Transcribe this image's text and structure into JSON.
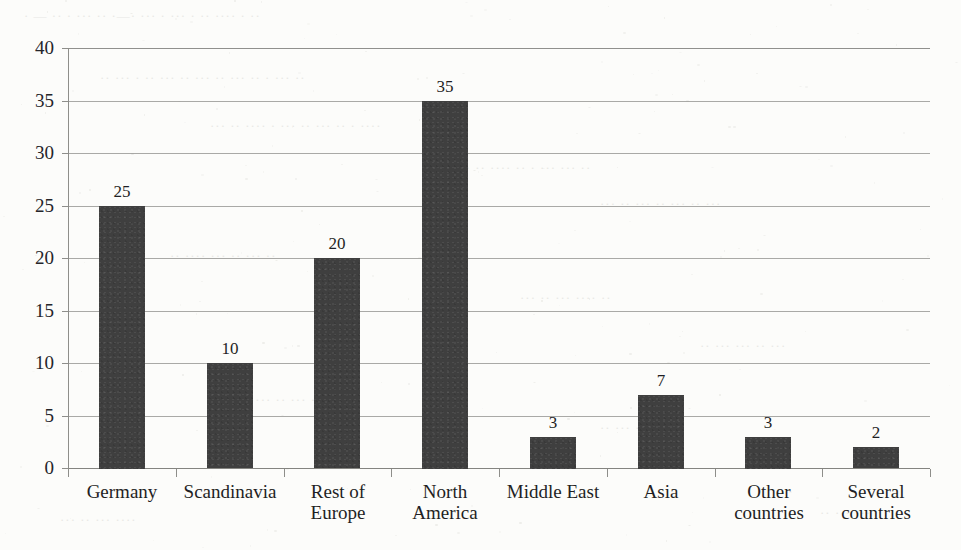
{
  "chart_data": {
    "type": "bar",
    "title": "",
    "subtitle": "",
    "xlabel": "",
    "ylabel": "",
    "ylim": [
      0,
      40
    ],
    "ytick_step": 5,
    "yticks": [
      "0",
      "5",
      "10",
      "15",
      "20",
      "25",
      "30",
      "35",
      "40"
    ],
    "grid": true,
    "legend": false,
    "categories": [
      "Germany",
      "Scandinavia",
      "Rest of\nEurope",
      "North\nAmerica",
      "Middle East",
      "Asia",
      "Other\ncountries",
      "Several\ncountries"
    ],
    "values": [
      25,
      10,
      20,
      35,
      3,
      7,
      3,
      2
    ],
    "value_labels": [
      "25",
      "10",
      "20",
      "35",
      "3",
      "7",
      "3",
      "2"
    ],
    "series": [
      {
        "name": "",
        "values": [
          25,
          10,
          20,
          35,
          3,
          7,
          3,
          2
        ]
      }
    ],
    "bar_color": "#3f3f3f",
    "gridline_color": "#9a9a96",
    "axis_color": "#8e8e8a",
    "background_color": "#fcfcfa"
  },
  "scan": {
    "bleed_lines": [
      {
        "text": "·  —  ··    · ···   ··  ·—·   ··· ·   ···  · ··   ···· ·   ··",
        "left": 24,
        "top": 8
      },
      {
        "text": "··  ···   · ··   ··· ··  ···   ·· ···  ··  · ···   ··",
        "left": 100,
        "top": 70
      },
      {
        "text": "···  ··   ····  · ···  ··   ···  ·· ·   ····",
        "left": 210,
        "top": 118
      },
      {
        "text": "·· ···   ··  ····  ··   · ···  ···   ··",
        "left": 440,
        "top": 160
      },
      {
        "text": "···  ··   ··· ··  ···   ·· ···",
        "left": 600,
        "top": 196
      },
      {
        "text": "··  ····   ···  ··   ··· ··",
        "left": 170,
        "top": 248
      },
      {
        "text": "···   ··  ···   ····  ··",
        "left": 520,
        "top": 290
      },
      {
        "text": "··  ···   ···  ··   ···",
        "left": 700,
        "top": 338
      },
      {
        "text": "····   ··  ···   ··",
        "left": 250,
        "top": 392
      },
      {
        "text": "··  ···   ····  ···",
        "left": 600,
        "top": 420
      },
      {
        "text": "···   ··  ···  ····",
        "left": 60,
        "top": 512
      },
      {
        "text": "··  ···   ···",
        "left": 820,
        "top": 505
      }
    ]
  }
}
